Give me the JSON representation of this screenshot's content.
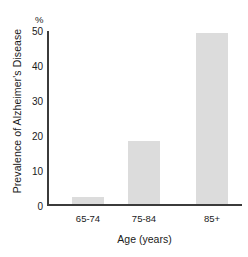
{
  "chart_data": {
    "type": "bar",
    "title": "",
    "categories": [
      "65-74",
      "75-84",
      "85+"
    ],
    "values": [
      2,
      18,
      49
    ],
    "xlabel": "Age (years)",
    "ylabel": "Prevalence of Alzheimer's Disease",
    "unit_label": "%",
    "ylim": [
      0,
      50
    ],
    "yticks": [
      0,
      10,
      20,
      30,
      40,
      50
    ],
    "ytick_labels": [
      "0",
      "10",
      "20",
      "30",
      "40",
      "50"
    ],
    "grid": false,
    "legend": null,
    "bar_color": "#dcdcdc",
    "axis_color": "#3b3b3b",
    "background_color": "#ffffff"
  }
}
